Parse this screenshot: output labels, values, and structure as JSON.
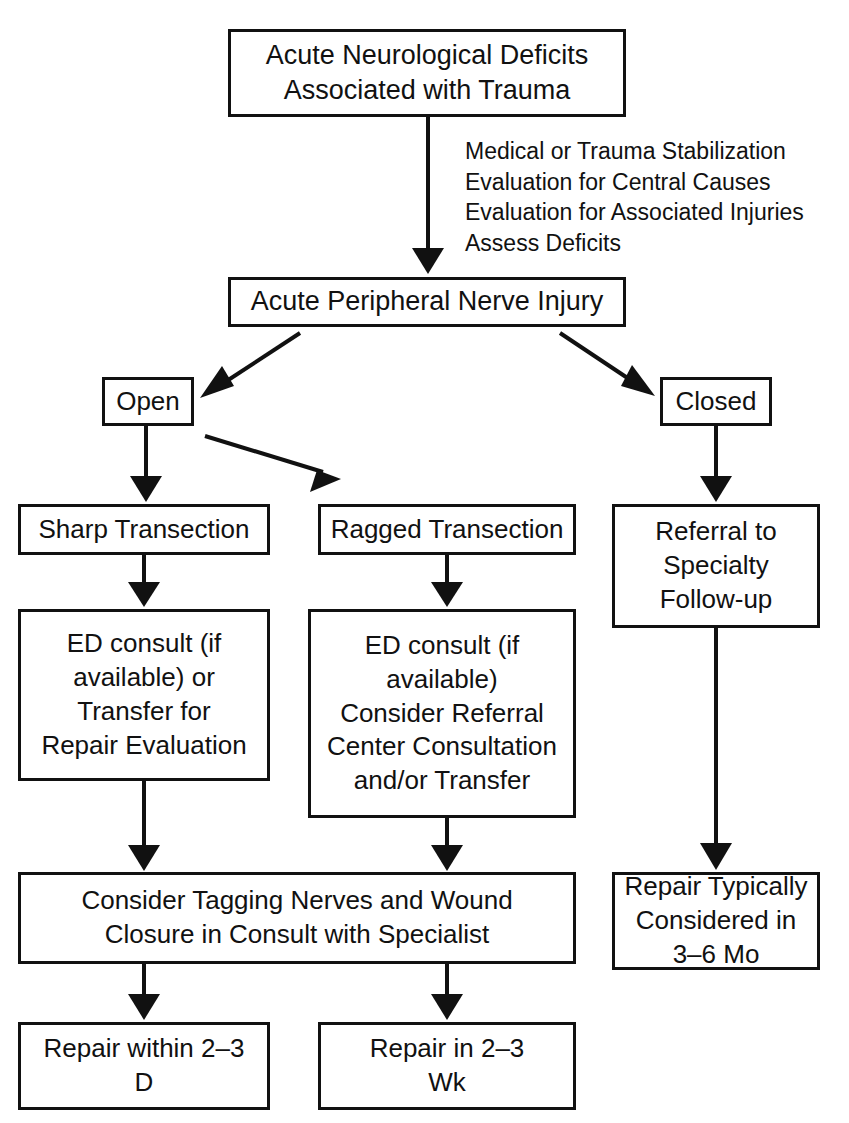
{
  "diagram": {
    "title_node": "Acute Neurological Deficits\nAssociated with Trauma",
    "annotation": "Medical or Trauma Stabilization\nEvaluation for Central Causes\nEvaluation for Associated Injuries\nAssess Deficits",
    "nodes": {
      "acute_peripheral_nerve_injury": "Acute Peripheral Nerve Injury",
      "open": "Open",
      "closed": "Closed",
      "sharp_transection": "Sharp Transection",
      "ragged_transection": "Ragged Transection",
      "referral_specialty": "Referral to\nSpecialty\nFollow-up",
      "ed_consult_left": "ED consult (if\navailable) or\nTransfer for\nRepair Evaluation",
      "ed_consult_middle": "ED consult (if\navailable)\nConsider Referral\nCenter Consultation\nand/or Transfer",
      "tagging_nerves": "Consider Tagging Nerves and Wound\nClosure in Consult with Specialist",
      "repair_typically": "Repair Typically\nConsidered in\n3–6 Mo",
      "repair_days": "Repair within 2–3\nD",
      "repair_weeks": "Repair in 2–3\nWk"
    },
    "colors": {
      "stroke": "#111111",
      "background": "#ffffff",
      "text": "#111111"
    },
    "edges": [
      {
        "from": "acute_neurological_deficits",
        "to": "acute_peripheral_nerve_injury",
        "style": "straight-down"
      },
      {
        "from": "acute_peripheral_nerve_injury",
        "to": "open",
        "style": "diagonal-left"
      },
      {
        "from": "acute_peripheral_nerve_injury",
        "to": "closed",
        "style": "diagonal-right"
      },
      {
        "from": "open",
        "to": "sharp_transection",
        "style": "straight-down"
      },
      {
        "from": "open",
        "to": "ragged_transection",
        "style": "diagonal-right"
      },
      {
        "from": "closed",
        "to": "referral_specialty",
        "style": "straight-down"
      },
      {
        "from": "sharp_transection",
        "to": "ed_consult_left",
        "style": "straight-down"
      },
      {
        "from": "ragged_transection",
        "to": "ed_consult_middle",
        "style": "straight-down"
      },
      {
        "from": "ed_consult_left",
        "to": "tagging_nerves",
        "style": "straight-down"
      },
      {
        "from": "ed_consult_middle",
        "to": "tagging_nerves",
        "style": "straight-down"
      },
      {
        "from": "referral_specialty",
        "to": "repair_typically",
        "style": "straight-down-long"
      },
      {
        "from": "tagging_nerves",
        "to": "repair_days",
        "style": "straight-down"
      },
      {
        "from": "tagging_nerves",
        "to": "repair_weeks",
        "style": "straight-down"
      }
    ]
  }
}
